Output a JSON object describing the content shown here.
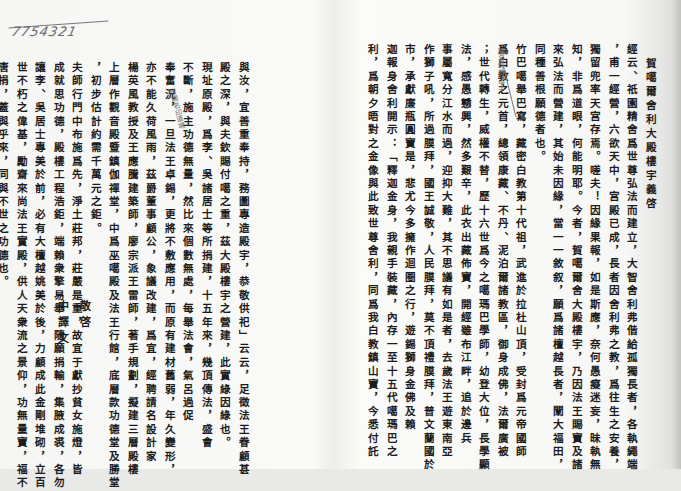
{
  "document": {
    "handwritten_note": {
      "scrawl": "~~~",
      "number": "7754321"
    },
    "right_page": {
      "title": "賀噶爾舍利大殿樓宇義啓",
      "columns": [
        "經云、祇園精舍爲世尊弘法而建立，大智舍利弗偕給孤獨長者，各執繩端",
        "，甫一經營，六欲天中，宮殿已成，長者因舍利弗之教，爲往生之安養，",
        "獨留兜率天宮存焉。嗟夫！因緣果報，如是斯應，奈何愚癡迷妄，昧執無",
        "知，非爲道眼，何能明耶。今者，賀噶爾舍大殿樓宇，乃因法王賜寶及諸",
        "來弘法而營建，其始未因緣，當一一敘叙，願爲諸檀越長者，闡大福田，",
        "同種善根願德者也。",
        "竹巴噶舉巴寫，藏密白教第十代祖，武進於拉杜山頂，受封爲元帝國師",
        "爲白教之元首，總領康藏、不丹、泥泊爾諸教區，御身成佛，法爾廣被",
        "；世代轉生，威權不替，歷十六世爲今之噶瑪巴學師，幼登大位，長學顯",
        "法，感愚戇興，然多艱辛，此衣出藏佈寶，開經雖布江畔，追於邊兵",
        "事屬寬分江水而過，迎抑大難，其不思議有如是者，去歲法王遊東南亞",
        "作獅子吼，所過膜拜，國王誠敬，人民膜拜，莫不頂禮膜拜，普文蘭國於",
        "市，承獻廉瓶圓寶是，悲尤今多擁作迴圈之行，遊錫獅身金佛及賴",
        "迦報身舍利開示：「釋迦金身，我親手裝藏，內存一至十五代噶瑪巴之",
        "利，爲朝夕晤對之金像與此致世尊舍利，同爲我白教鎮山寶，今悉付託"
      ],
      "margin_annotation": "賜名印首法王"
    },
    "left_page": {
      "columns": [
        "與汝，宜善重奉持，務圖專造殿宇，恭敬供祀」云云，足徵法王眷顧甚",
        "殿之深，與夫欽賜付噶之重，茲大殿樓宇之營建，此實綠因綠也。",
        "現址原殿，爲李、吳諸居士等所捐建，十五年來，幾頂傳法，盛會",
        "不斷，施主功德無量，然比來個數無處，每舉法會，氣呂過促",
        "奉奮況，一旦法王卓錫，更將不敷應用，而原有建材舊弱，年久變形，",
        "亦不能久荷風雨，茲爵董事顧公，象議改建，爲宜，經聘請名設計家",
        "楊英風教授及王應騰建築師，廖宗派王雷師，著手規劃，擬建三層殿樓",
        "上層作觀音殿暨鎮伽禪堂，中爲巫噶殿及法王行館，底層款功德堂及勝堂",
        "，初步估計約需千萬元之鉅。",
        "夫師行門中布施爲先，淨土莊邦，莊嚴是重，故宜于獻抄貧女施燈，皆",
        "成就思功德，殿樓工程浩鉅，端賴衆擎易舉，隨願捐輸，集腋成裘，各勿",
        "讓李、吳居士專美於前，必有大檀越姚美於後，力顧成此金剛堆砌，立百",
        "世不朽之偉基，勵齋來尚法王實殿，供人天衆流之景仰，功無量寶，福不",
        "唐捐，蓋與乎來，同與不世之功德也。"
      ],
      "signature": {
        "org": "中譯文",
        "closing": "敬啓"
      },
      "margin_annotation": "附賜名印道場"
    }
  }
}
